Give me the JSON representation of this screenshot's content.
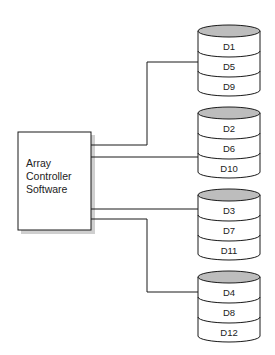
{
  "diagram": {
    "controller": {
      "lines": [
        "Array",
        "Controller",
        "Software"
      ]
    },
    "colors": {
      "stroke": "#1a1a1a",
      "cylinder_top": "#bdbdbd",
      "shadow": "#c8c8c8",
      "background": "#ffffff"
    },
    "arrays": [
      {
        "disks": [
          "D1",
          "D5",
          "D9"
        ]
      },
      {
        "disks": [
          "D2",
          "D6",
          "D10"
        ]
      },
      {
        "disks": [
          "D3",
          "D7",
          "D11"
        ]
      },
      {
        "disks": [
          "D4",
          "D8",
          "D12"
        ]
      }
    ]
  }
}
